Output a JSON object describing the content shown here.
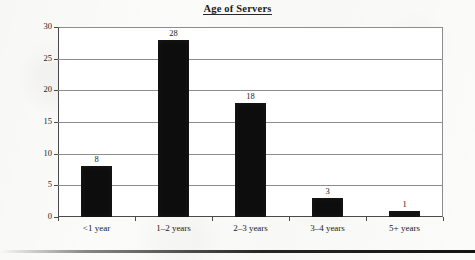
{
  "chart_data": {
    "type": "bar",
    "title": "Age of Servers",
    "xlabel": "",
    "ylabel": "",
    "categories": [
      "<1 year",
      "1–2 years",
      "2–3 years",
      "3–4 years",
      "5+ years"
    ],
    "values": [
      8,
      28,
      18,
      3,
      1
    ],
    "value_labels": [
      "8",
      "28",
      "18",
      "3",
      "1"
    ],
    "ylim": [
      0,
      30
    ],
    "ytick_labels": [
      "0",
      "5",
      "10",
      "15",
      "20",
      "25",
      "30"
    ],
    "ytick_values": [
      0,
      5,
      10,
      15,
      20,
      25,
      30
    ],
    "grid": "horizontal",
    "legend": "none",
    "bar_color": "#0d0d0d",
    "grid_color": "#8d8d8d",
    "axis_color": "#4a4a4a",
    "background_color": "#ffffff"
  }
}
